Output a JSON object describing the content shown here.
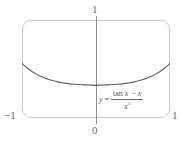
{
  "figure": {
    "kind": "graphing-calculator-viewport",
    "frame_color": "#c9c9c9",
    "axis_color": "#8e8e8e",
    "curve_color": "#5a5a5a",
    "label_color": "#6a6a6a"
  },
  "labels": {
    "top": "1",
    "bottom": "0",
    "left": "−1",
    "right": "1"
  },
  "equation": {
    "lhs": "y",
    "equals": "=",
    "numerator_fn": "tan",
    "numerator_rest": " x − x",
    "denominator_base": "x",
    "denominator_exp": "3",
    "plain": "y = (tan x − x) / x³"
  },
  "chart_data": {
    "type": "line",
    "title": "",
    "subtitle": "",
    "xlabel": "",
    "ylabel": "",
    "xlim": [
      -1,
      1
    ],
    "ylim": [
      0,
      1
    ],
    "grid": false,
    "legend": null,
    "annotations": [
      {
        "text": "y = (tan x − x) / x³",
        "x": 0.12,
        "y": 0.23
      }
    ],
    "xticks": [
      -1,
      0,
      1
    ],
    "xticklabels": [
      "−1",
      "0",
      "1"
    ],
    "yticks": [
      1
    ],
    "yticklabels": [
      "1"
    ],
    "series": [
      {
        "name": "y = (tan x - x)/x^3",
        "color": "#5a5a5a",
        "x": [
          -1.0,
          -0.95,
          -0.9,
          -0.85,
          -0.8,
          -0.75,
          -0.7,
          -0.65,
          -0.6,
          -0.55,
          -0.5,
          -0.45,
          -0.4,
          -0.35,
          -0.3,
          -0.25,
          -0.2,
          -0.15,
          -0.1,
          -0.05,
          0.0,
          0.05,
          0.1,
          0.15,
          0.2,
          0.25,
          0.3,
          0.35,
          0.4,
          0.45,
          0.5,
          0.55,
          0.6,
          0.65,
          0.7,
          0.75,
          0.8,
          0.85,
          0.9,
          0.95,
          1.0
        ],
        "y": [
          0.5574,
          0.5226,
          0.4928,
          0.4672,
          0.4452,
          0.4263,
          0.4101,
          0.3962,
          0.3844,
          0.3743,
          0.3659,
          0.3588,
          0.353,
          0.3483,
          0.3445,
          0.3415,
          0.3392,
          0.3376,
          0.3365,
          0.3358,
          0.3333,
          0.3358,
          0.3365,
          0.3376,
          0.3392,
          0.3415,
          0.3445,
          0.3483,
          0.353,
          0.3588,
          0.3659,
          0.3743,
          0.3844,
          0.3962,
          0.4101,
          0.4263,
          0.4452,
          0.4672,
          0.4928,
          0.5226,
          0.5574
        ],
        "minimum": {
          "x": 0,
          "y": 0.3333
        }
      }
    ]
  }
}
